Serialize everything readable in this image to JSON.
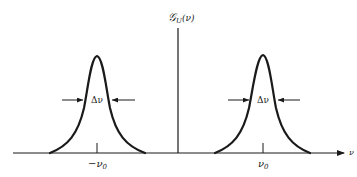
{
  "diagram": {
    "type": "spectral density plot",
    "y_axis_label": {
      "main": "𝒢",
      "subscript": "U",
      "argument": "(ν)"
    },
    "x_axis_label": "ν",
    "peaks": [
      {
        "id": "negative",
        "center_label": "−ν",
        "center_sub": "0",
        "width_label": "Δν"
      },
      {
        "id": "positive",
        "center_label": "ν",
        "center_sub": "0",
        "width_label": "Δν"
      }
    ],
    "colors": {
      "stroke": "#1a1a1a",
      "background": "#ffffff"
    }
  }
}
